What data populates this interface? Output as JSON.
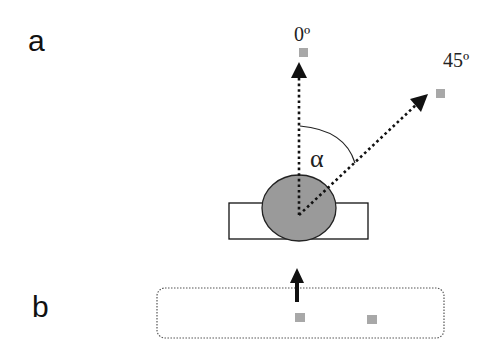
{
  "panels": {
    "a": {
      "label": "a"
    },
    "b": {
      "label": "b"
    }
  },
  "angles": {
    "zero": "0º",
    "forty_five": "45º",
    "alpha": "α"
  },
  "colors": {
    "stroke": "#111111",
    "ball_fill": "#9a9a9a",
    "marker_fill": "#a8a8a8",
    "dashed_box": "#555555"
  }
}
